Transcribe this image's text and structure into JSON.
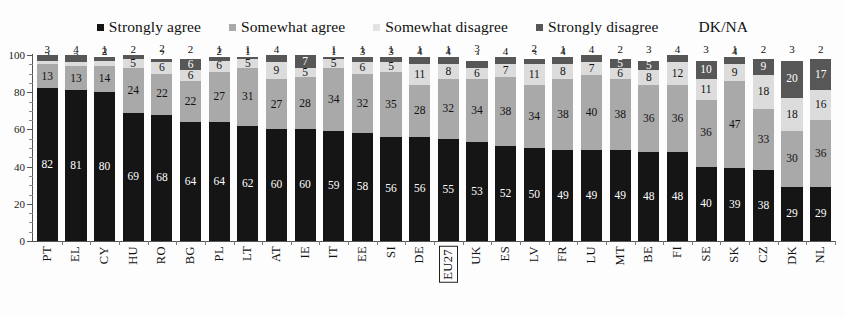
{
  "chart_data": {
    "type": "bar",
    "subtype": "stacked-100-percent-vertical",
    "title": "",
    "xlabel": "",
    "ylabel": "",
    "ylim": [
      0,
      100
    ],
    "yticks": [
      0,
      20,
      40,
      60,
      80,
      100
    ],
    "grid": false,
    "legend_position": "top-center",
    "highlighted_category": "EU27",
    "categories": [
      "PT",
      "EL",
      "CY",
      "HU",
      "RO",
      "BG",
      "PL",
      "LT",
      "AT",
      "IE",
      "IT",
      "EE",
      "SI",
      "DE",
      "EU27",
      "UK",
      "ES",
      "LV",
      "FR",
      "LU",
      "MT",
      "BE",
      "FI",
      "SE",
      "SK",
      "CZ",
      "DK",
      "NL"
    ],
    "series": [
      {
        "name": "Strongly agree",
        "color": "#151515",
        "values": [
          82,
          81,
          80,
          69,
          68,
          64,
          64,
          62,
          60,
          60,
          59,
          58,
          56,
          56,
          55,
          53,
          52,
          50,
          49,
          49,
          49,
          48,
          48,
          40,
          39,
          38,
          29,
          29
        ]
      },
      {
        "name": "Somewhat agree",
        "color": "#a9a9a9",
        "values": [
          13,
          13,
          14,
          24,
          22,
          22,
          27,
          31,
          27,
          28,
          34,
          32,
          35,
          28,
          32,
          34,
          38,
          34,
          38,
          40,
          38,
          36,
          36,
          36,
          47,
          33,
          30,
          36
        ]
      },
      {
        "name": "Somewhat disagree",
        "color": "#dcdcdc",
        "values": [
          2,
          2,
          3,
          5,
          6,
          6,
          6,
          5,
          9,
          5,
          5,
          6,
          5,
          11,
          8,
          6,
          7,
          11,
          8,
          7,
          6,
          8,
          12,
          11,
          9,
          18,
          18,
          16
        ]
      },
      {
        "name": "Strongly disagree",
        "color": "#575757",
        "values": [
          3,
          4,
          2,
          2,
          2,
          6,
          2,
          1,
          4,
          7,
          1,
          3,
          3,
          4,
          4,
          4,
          4,
          3,
          4,
          4,
          5,
          5,
          4,
          10,
          4,
          9,
          20,
          17
        ]
      },
      {
        "name": "DK/NA",
        "color": "#ffffff",
        "values": [
          0,
          0,
          1,
          0,
          2,
          2,
          1,
          1,
          0,
          0,
          1,
          1,
          1,
          1,
          1,
          3,
          -1,
          2,
          1,
          0,
          2,
          3,
          0,
          3,
          1,
          2,
          3,
          2
        ]
      }
    ]
  },
  "legend": {
    "items": [
      {
        "label": "Strongly agree",
        "swatch": "legend-swatch-strongly-agree",
        "color": "#151515"
      },
      {
        "label": "Somewhat agree",
        "swatch": "legend-swatch-somewhat-agree",
        "color": "#a9a9a9"
      },
      {
        "label": "Somewhat disagree",
        "swatch": "legend-swatch-somewhat-disagree",
        "color": "#e2e2e2"
      },
      {
        "label": "Strongly disagree",
        "swatch": "legend-swatch-strongly-disagree",
        "color": "#575757"
      },
      {
        "label": "DK/NA",
        "swatch": "legend-swatch-dk-na",
        "color": "#ffffff"
      }
    ]
  },
  "axis": {
    "y_ticks": [
      "100",
      "80",
      "60",
      "40",
      "20",
      "0"
    ]
  }
}
